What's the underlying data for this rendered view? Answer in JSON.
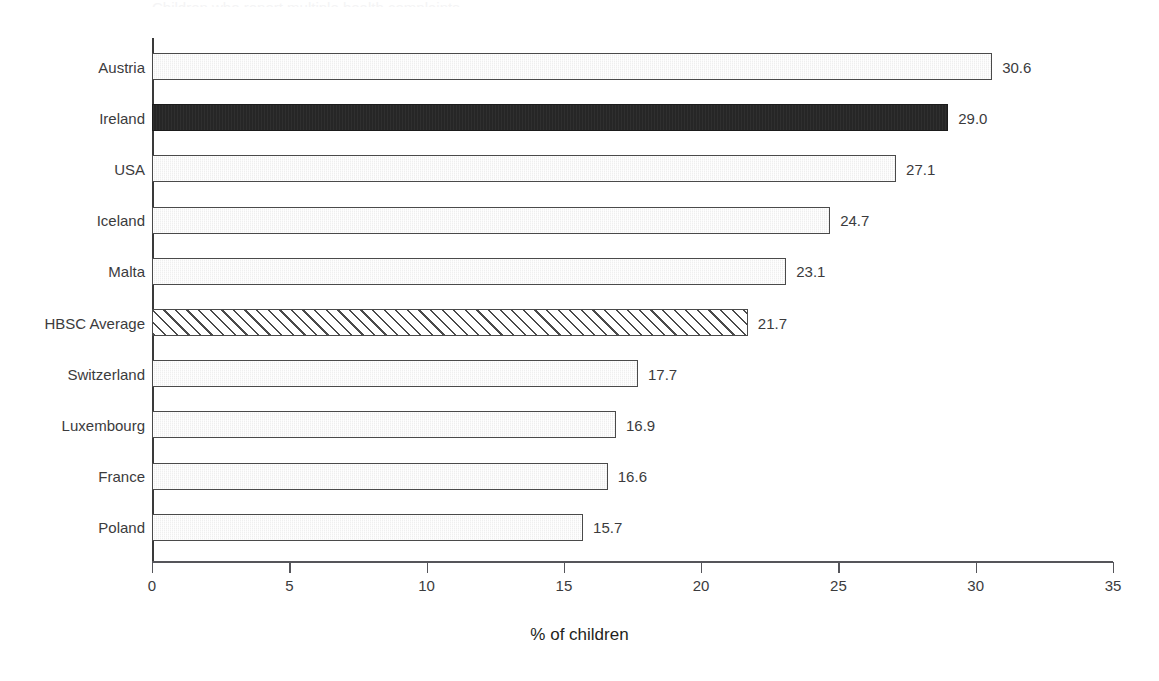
{
  "chart_data": {
    "type": "bar",
    "orientation": "horizontal",
    "title": "",
    "xlabel": "% of children",
    "ylabel": "",
    "xlim": [
      0,
      35
    ],
    "xticks": [
      "0",
      "5",
      "10",
      "15",
      "20",
      "25",
      "30",
      "35"
    ],
    "grid": false,
    "legend": "none",
    "categories": [
      "Austria",
      "Ireland",
      "USA",
      "Iceland",
      "Malta",
      "HBSC Average",
      "Switzerland",
      "Luxembourg",
      "France",
      "Poland"
    ],
    "values": [
      30.6,
      29.0,
      27.1,
      24.7,
      23.1,
      21.7,
      17.7,
      16.9,
      16.6,
      15.7
    ],
    "value_labels": [
      "30.6",
      "29.0",
      "27.1",
      "24.7",
      "23.1",
      "21.7",
      "17.7",
      "16.9",
      "16.6",
      "15.7"
    ],
    "bar_styles": [
      "light",
      "dark",
      "light",
      "light",
      "light",
      "hatch",
      "light",
      "light",
      "light",
      "light"
    ],
    "highlight_category": "Ireland",
    "average_category": "HBSC Average"
  },
  "colors": {
    "bar_light_fill": "#efefef",
    "bar_dark_fill": "#262626",
    "bar_hatch_fill": "#ffffff",
    "bar_outline": "#4a4a4a",
    "axis": "#55555a",
    "text": "#3b3b3d",
    "background": "#ffffff"
  },
  "title_sliver": {
    "text": "Children who report multiple health complaints"
  },
  "axis": {
    "x_title": "% of children"
  },
  "ticks": {
    "t0": "0",
    "t1": "5",
    "t2": "10",
    "t3": "15",
    "t4": "20",
    "t5": "25",
    "t6": "30",
    "t7": "35"
  }
}
